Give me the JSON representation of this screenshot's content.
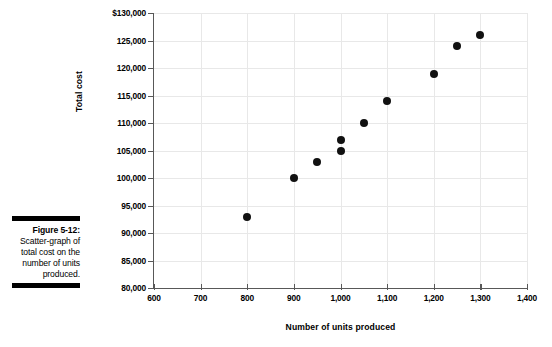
{
  "figure": {
    "label": "Figure 5-12:",
    "caption": "Scatter-graph of total cost on the number of units produced."
  },
  "chart_data": {
    "type": "scatter",
    "title": "",
    "xlabel": "Number of units produced",
    "ylabel": "Total cost",
    "xlim": [
      600,
      1400
    ],
    "ylim": [
      80000,
      130000
    ],
    "grid": true,
    "legend": "none",
    "x_ticks": [
      "600",
      "700",
      "800",
      "900",
      "1,000",
      "1,100",
      "1,200",
      "1,300",
      "1,400"
    ],
    "x_tick_values": [
      600,
      700,
      800,
      900,
      1000,
      1100,
      1200,
      1300,
      1400
    ],
    "y_ticks": [
      "$130,000",
      "125,000",
      "120,000",
      "115,000",
      "110,000",
      "105,000",
      "100,000",
      "95,000",
      "90,000",
      "85,000",
      "80,000"
    ],
    "y_tick_values": [
      130000,
      125000,
      120000,
      115000,
      110000,
      105000,
      100000,
      95000,
      90000,
      85000,
      80000
    ],
    "points": [
      {
        "x": 800,
        "y": 93000
      },
      {
        "x": 900,
        "y": 100000
      },
      {
        "x": 950,
        "y": 103000
      },
      {
        "x": 1000,
        "y": 105000
      },
      {
        "x": 1000,
        "y": 107000
      },
      {
        "x": 1050,
        "y": 110000
      },
      {
        "x": 1100,
        "y": 114000
      },
      {
        "x": 1200,
        "y": 119000
      },
      {
        "x": 1250,
        "y": 124000
      },
      {
        "x": 1300,
        "y": 126000
      }
    ],
    "colors": {
      "marker": "#111111",
      "axis": "#585858",
      "grid": "#e8e8e8",
      "text": "#000000"
    }
  }
}
